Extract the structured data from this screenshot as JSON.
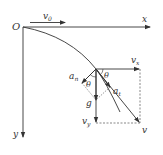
{
  "diagram": {
    "type": "projectile-motion-velocity-decomposition",
    "labels": {
      "origin": "O",
      "x_axis": "x",
      "y_axis": "y",
      "initial_velocity": "v",
      "initial_velocity_sub": "0",
      "vx": "v",
      "vx_sub": "x",
      "vy": "v",
      "vy_sub": "y",
      "velocity": "v",
      "normal_accel": "a",
      "normal_accel_sub": "n",
      "tangential_accel": "a",
      "tangential_accel_sub": "t",
      "gravity": "g",
      "angle_top": "θ",
      "angle_left": "θ"
    },
    "colors": {
      "line": "#333333",
      "dashed": "#555555",
      "background": "#ffffff"
    }
  }
}
